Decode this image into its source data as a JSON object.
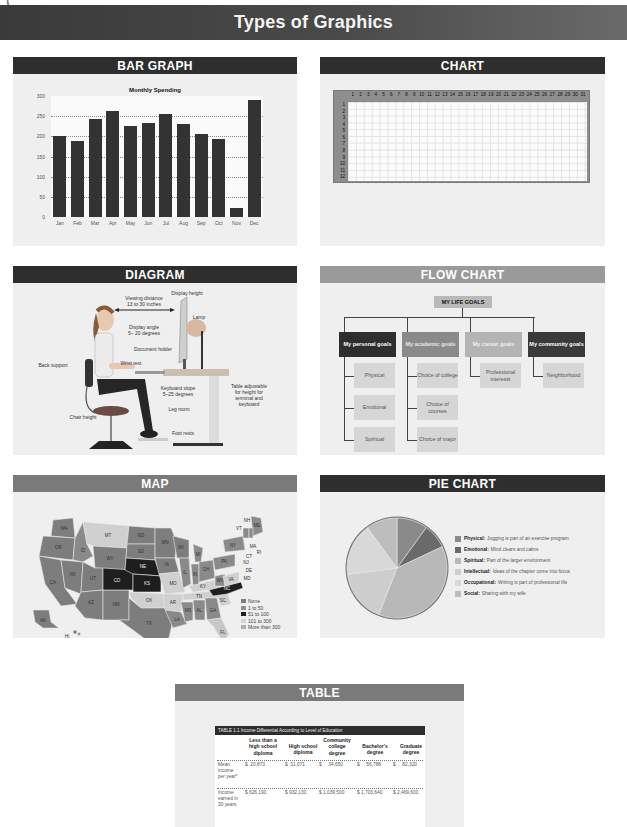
{
  "banner": {
    "title": "Types of Graphics"
  },
  "panels": {
    "bar_graph": {
      "heading": "BAR GRAPH"
    },
    "chart": {
      "heading": "CHART"
    },
    "diagram": {
      "heading": "DIAGRAM"
    },
    "flow_chart": {
      "heading": "FLOW CHART"
    },
    "map": {
      "heading": "MAP"
    },
    "pie_chart": {
      "heading": "PIE CHART"
    },
    "table": {
      "heading": "TABLE"
    }
  },
  "chart_data": [
    {
      "type": "bar",
      "title": "Monthly Spending",
      "xlabel": "",
      "ylabel": "",
      "ylim": [
        0,
        300
      ],
      "yticks": [
        0,
        50,
        100,
        150,
        200,
        250,
        300
      ],
      "grid": true,
      "categories": [
        "Jan",
        "Feb",
        "Mar",
        "Apr",
        "May",
        "Jun",
        "Jul",
        "Aug",
        "Sep",
        "Oct",
        "Nov",
        "Dec"
      ],
      "values": [
        200,
        188,
        243,
        262,
        225,
        232,
        256,
        230,
        207,
        193,
        22,
        290
      ]
    },
    {
      "type": "table",
      "title": "Calendar grid",
      "columns": [
        "1",
        "2",
        "3",
        "4",
        "5",
        "6",
        "7",
        "8",
        "9",
        "10",
        "11",
        "12",
        "13",
        "14",
        "15",
        "16",
        "17",
        "18",
        "19",
        "20",
        "21",
        "22",
        "23",
        "24",
        "25",
        "26",
        "27",
        "28",
        "29",
        "30",
        "31"
      ],
      "rows": [
        "1",
        "2",
        "3",
        "4",
        "5",
        "6",
        "7",
        "8",
        "9",
        "10",
        "11",
        "12"
      ]
    },
    {
      "type": "pie",
      "title": "",
      "legend_position": "right",
      "slices": [
        {
          "label": "Physical",
          "description": "Jogging is part of an exercise program",
          "value": 10,
          "color": "#8a8a8a"
        },
        {
          "label": "Emotional",
          "description": "Mind clears and calms",
          "value": 8,
          "color": "#6a6a6a"
        },
        {
          "label": "Spiritual",
          "description": "Part of the larger environment",
          "value": 38,
          "color": "#b8b8b8"
        },
        {
          "label": "Intellectual",
          "description": "Ideas of the chapter come into focus",
          "value": 17,
          "color": "#cdcdcd"
        },
        {
          "label": "Occupational",
          "description": "Writing is part of professional life",
          "value": 17,
          "color": "#d8d8d8"
        },
        {
          "label": "Social",
          "description": "Sharing with my wife",
          "value": 10,
          "color": "#bdbdbd"
        }
      ]
    },
    {
      "type": "table",
      "title": "TABLE 1.1   Income Differential According to Level of Education",
      "columns": [
        "",
        "Less than a high school diploma",
        "High school diploma",
        "Community college degree",
        "Bachelor's degree",
        "Graduate degree"
      ],
      "rows": [
        [
          "Mean income per year*",
          "$ 20,873",
          "$ 31,071",
          "$ 34,650",
          "$ 56,788",
          "$ 82,320"
        ],
        [
          "Income earned in 30 years",
          "$ 626,190",
          "$ 932,130",
          "$ 1,039,500",
          "$ 1,703,640",
          "$ 2,469,600"
        ]
      ]
    }
  ],
  "bar_graph": {
    "title": "Monthly Spending",
    "y_ticks": [
      "0",
      "50",
      "100",
      "150",
      "200",
      "250",
      "300"
    ],
    "months": [
      "Jan",
      "Feb",
      "Mar",
      "Apr",
      "May",
      "Jun",
      "Jul",
      "Aug",
      "Sep",
      "Oct",
      "Nov",
      "Dec"
    ]
  },
  "diagram": {
    "labels": {
      "viewing_distance": "Viewing distance\n13 to 30 inches",
      "display_height": "Display height",
      "lamp": "Lamp",
      "display_angle": "Display angle\n5– 20 degrees",
      "document_holder": "Document holder",
      "wrist_rest": "Wrist rest",
      "back_support": "Back support",
      "keyboard_slope": "Keyboard slope\n5–25 degrees",
      "table_adjustable": "Table adjustable\nfor height for\nterminal and\nkeyboard",
      "leg_room": "Leg room",
      "chair_height": "Chair height",
      "foot_rests": "Foot rests"
    }
  },
  "flow_chart": {
    "root": "MY LIFE GOALS",
    "goals": [
      {
        "label": "My personal goals",
        "children": [
          "Physical",
          "Emotional",
          "Spiritual"
        ]
      },
      {
        "label": "My academic goals",
        "children": [
          "Choice of college",
          "Choice of courses",
          "Choice of major"
        ]
      },
      {
        "label": "My career goals",
        "children": [
          "Professional interests"
        ]
      },
      {
        "label": "My community goals",
        "children": [
          "Neighborhood"
        ]
      }
    ]
  },
  "map": {
    "states": [
      "WA",
      "OR",
      "CA",
      "NV",
      "ID",
      "MT",
      "WY",
      "UT",
      "AZ",
      "NM",
      "CO",
      "ND",
      "SD",
      "NE",
      "KS",
      "OK",
      "TX",
      "MN",
      "IA",
      "MO",
      "AR",
      "LA",
      "WI",
      "IL",
      "MI",
      "IN",
      "OH",
      "KY",
      "TN",
      "MS",
      "AL",
      "GA",
      "FL",
      "SC",
      "NC",
      "VA",
      "WV",
      "PA",
      "NY",
      "VT",
      "NH",
      "ME",
      "MA",
      "RI",
      "CT",
      "NJ",
      "DE",
      "MD",
      "AK",
      "HI"
    ],
    "legend": [
      {
        "label": "None",
        "color": "#7d7d7d"
      },
      {
        "label": "1 to 50",
        "color": "#8f8f8f"
      },
      {
        "label": "51 to 100",
        "color": "#1e1e1e"
      },
      {
        "label": "101 to 300",
        "color": "#d4d4d4"
      },
      {
        "label": "More than 300",
        "color": "#b0b0b0"
      }
    ]
  },
  "table": {
    "caption": "TABLE 1.1   Income Differential According to Level of Education",
    "columns": [
      "Less than a\nhigh school\ndiploma",
      "High school\ndiploma",
      "Community\ncollege\ndegree",
      "Bachelor's\ndegree",
      "Graduate\ndegree"
    ],
    "rows": [
      {
        "label": "Mean\nincome\nper year*",
        "cells": [
          "$  20,873",
          "$  31,071",
          "$     34,650",
          "$     56,788",
          "$     82,320"
        ]
      },
      {
        "label": "Income\nearned in\n30 years",
        "cells": [
          "$ 626,190",
          "$ 932,130",
          "$ 1,039,500",
          "$ 1,703,640",
          "$ 2,469,600"
        ]
      }
    ]
  }
}
